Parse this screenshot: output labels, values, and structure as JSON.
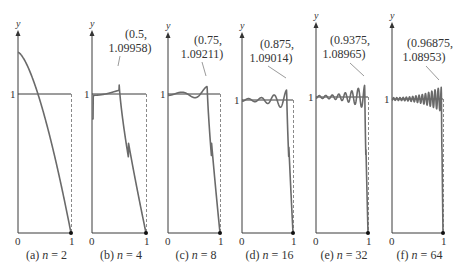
{
  "figure": {
    "panels": [
      {
        "caption_prefix": "(a) ",
        "caption_var": "n",
        "caption_eq": " = 2",
        "n": 2,
        "ylabel": "y",
        "tick0": "0",
        "tick1": "1",
        "one_label": "1",
        "annotation": null
      },
      {
        "caption_prefix": "(b) ",
        "caption_var": "n",
        "caption_eq": " = 4",
        "n": 4,
        "ylabel": "y",
        "tick0": "0",
        "tick1": "1",
        "one_label": "1",
        "annotation": {
          "line1": "(0.5,",
          "line2": "1.09958)"
        }
      },
      {
        "caption_prefix": "(c) ",
        "caption_var": "n",
        "caption_eq": " = 8",
        "n": 8,
        "ylabel": "y",
        "tick0": "0",
        "tick1": "1",
        "one_label": "1",
        "annotation": {
          "line1": "(0.75,",
          "line2": "1.09211)"
        }
      },
      {
        "caption_prefix": "(d) ",
        "caption_var": "n",
        "caption_eq": " = 16",
        "n": 16,
        "ylabel": "y",
        "tick0": "0",
        "tick1": "1",
        "one_label": "1",
        "annotation": {
          "line1": "(0.875,",
          "line2": "1.09014)"
        }
      },
      {
        "caption_prefix": "(e) ",
        "caption_var": "n",
        "caption_eq": " = 32",
        "n": 32,
        "ylabel": "y",
        "tick0": "0",
        "tick1": "1",
        "one_label": "1",
        "annotation": {
          "line1": "(0.9375,",
          "line2": "1.08965)"
        }
      },
      {
        "caption_prefix": "(f) ",
        "caption_var": "n",
        "caption_eq": " = 64",
        "n": 64,
        "ylabel": "y",
        "tick0": "0",
        "tick1": "1",
        "one_label": "1",
        "annotation": {
          "line1": "(0.96875,",
          "line2": "1.08953)"
        }
      }
    ]
  },
  "chart_data": {
    "type": "line",
    "title": "",
    "xlabel": "",
    "ylabel": "y",
    "xlim": [
      0,
      1
    ],
    "grid": false,
    "reference_line": {
      "y": 1,
      "x_range": [
        0,
        1
      ]
    },
    "series": [
      {
        "name": "(a) n = 2",
        "n": 2,
        "max_point": null,
        "value_at_0": 1.3,
        "value_at_1": 0
      },
      {
        "name": "(b) n = 4",
        "n": 4,
        "max_point": {
          "x": 0.5,
          "y": 1.09958
        },
        "value_at_1": 0
      },
      {
        "name": "(c) n = 8",
        "n": 8,
        "max_point": {
          "x": 0.75,
          "y": 1.09211
        },
        "value_at_1": 0
      },
      {
        "name": "(d) n = 16",
        "n": 16,
        "max_point": {
          "x": 0.875,
          "y": 1.09014
        },
        "value_at_1": 0
      },
      {
        "name": "(e) n = 32",
        "n": 32,
        "max_point": {
          "x": 0.9375,
          "y": 1.08965
        },
        "value_at_1": 0
      },
      {
        "name": "(f) n = 64",
        "n": 64,
        "max_point": {
          "x": 0.96875,
          "y": 1.08953
        },
        "value_at_1": 0
      }
    ],
    "xticks": [
      "0",
      "1"
    ],
    "yticks": [
      "1"
    ]
  }
}
